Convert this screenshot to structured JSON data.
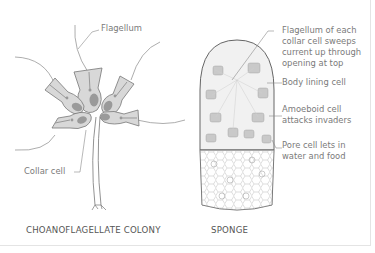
{
  "diagrams": [
    {
      "title": "CHOANOFLAGELLATE COLONY",
      "labels": {
        "flagellum": "Flagellum",
        "collar_cell": "Collar cell"
      }
    },
    {
      "title": "SPONGE",
      "labels": {
        "flagellum_line1": "Flagellum of each",
        "flagellum_line2": "collar cell sweeps",
        "flagellum_line3": "current up through",
        "flagellum_line4": "opening at top",
        "body_lining": "Body lining cell",
        "amoeboid_line1": "Amoeboid cell",
        "amoeboid_line2": "attacks invaders",
        "pore_line1": "Pore cell lets in",
        "pore_line2": "water and food"
      }
    }
  ],
  "colors": {
    "line": "#8a8a8a",
    "cell_fill": "#d8d8d8",
    "nucleus": "#9a9a9a",
    "label_text": "#7a7a7a",
    "caption_text": "#555555"
  }
}
